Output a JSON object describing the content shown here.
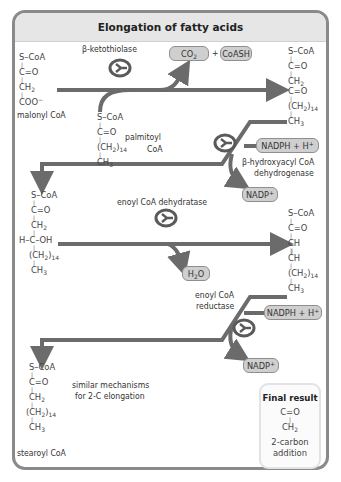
{
  "title": "Elongation of fatty acids",
  "colors": {
    "arrow": "#6b6b6b",
    "border": "#8a8a8a",
    "title_bg": "#e6e6e6",
    "pill_bg": "#cfcfcf",
    "enzyme_icon": "#5a5a5a"
  },
  "molecules": {
    "malonyl_coa": {
      "label": "malonyl CoA",
      "lines": [
        "S–CoA",
        "C=O",
        "CH2",
        "COO−"
      ]
    },
    "palmitoyl_coa": {
      "label_line1": "palmitoyl",
      "label_line2": "CoA",
      "lines": [
        "S–CoA",
        "C=O",
        "(CH2)14",
        "CH3"
      ]
    },
    "ketoacyl_coa": {
      "lines": [
        "S–CoA",
        "C=O",
        "CH2",
        "C=O",
        "(CH2)14",
        "CH3"
      ]
    },
    "hydroxyacyl_coa": {
      "lines": [
        "S–CoA",
        "C=O",
        "CH2",
        "H–C–OH",
        "(CH2)14",
        "CH3"
      ]
    },
    "enoyl_coa": {
      "lines": [
        "S–CoA",
        "C=O",
        "CH",
        "CH",
        "(CH2)14",
        "CH3"
      ]
    },
    "stearoyl_coa": {
      "label": "stearoyl CoA",
      "lines": [
        "S–CoA",
        "C=O",
        "CH2",
        "(CH2)14",
        "CH3"
      ]
    }
  },
  "enzymes": {
    "step1": "β-ketothiolase",
    "step2_line1": "β-hydroxyacyl CoA",
    "step2_line2": "dehydrogenase",
    "step3": "enoyl CoA dehydratase",
    "step4_line1": "enoyl CoA",
    "step4_line2": "reductase"
  },
  "byproducts": {
    "co2": "CO2",
    "plus": "+",
    "coash": "CoASH",
    "nadph_1": "NADPH + H+",
    "nadp_1": "NADP+",
    "h2o": "H2O",
    "nadph_2": "NADPH + H+",
    "nadp_2": "NADP+"
  },
  "note_line1": "similar mechanisms",
  "note_line2": "for 2-C elongation",
  "final_result": {
    "title": "Final result",
    "line1": "C=O",
    "line2": "CH2",
    "desc_line1": "2-carbon",
    "desc_line2": "addition"
  }
}
